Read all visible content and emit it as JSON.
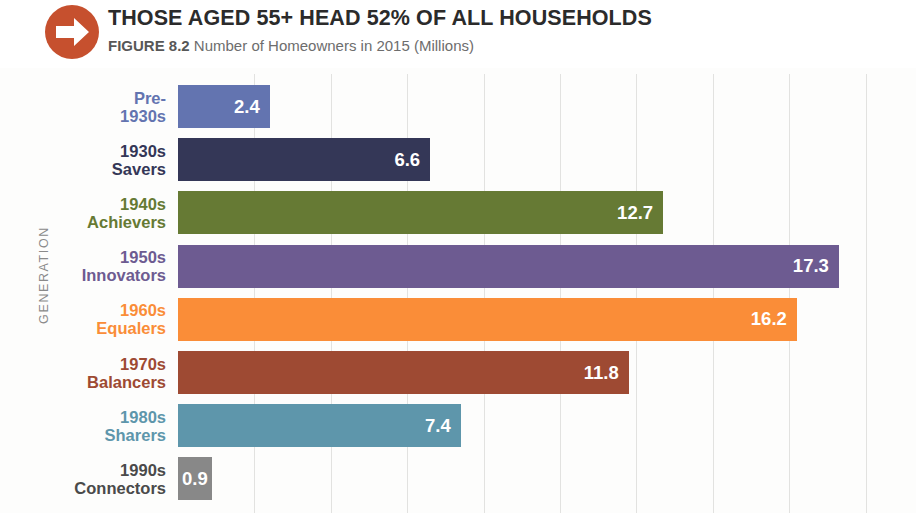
{
  "header": {
    "icon": "right-arrow-circle-icon",
    "icon_color": "#c6502e",
    "title": "THOSE AGED 55+ HEAD 52% OF ALL HOUSEHOLDS",
    "figure_label": "FIGURE 8.2",
    "subtitle": "Number of Homeowners in 2015 (Millions)"
  },
  "chart_data": {
    "type": "bar",
    "orientation": "horizontal",
    "title": "THOSE AGED 55+ HEAD 52% OF ALL HOUSEHOLDS",
    "subtitle": "Number of Homeowners in 2015 (Millions)",
    "xlabel": "",
    "ylabel": "GENERATION",
    "xlim": [
      0,
      19.3
    ],
    "ylim": [],
    "grid": true,
    "grid_axis": "x",
    "grid_step": 2,
    "gridline_values": [
      2,
      4,
      6,
      8,
      10,
      12,
      14,
      16,
      18
    ],
    "legend": "none",
    "tick_labels_visible": false,
    "categories": [
      "Pre-\n1930s",
      "1930s\nSavers",
      "1940s\nAchievers",
      "1950s\nInnovators",
      "1960s\nEqualers",
      "1970s\nBalancers",
      "1980s\nSharers",
      "1990s\nConnectors"
    ],
    "values": [
      2.4,
      6.6,
      12.7,
      17.3,
      16.2,
      11.8,
      7.4,
      0.9
    ],
    "value_labels": [
      "2.4",
      "6.6",
      "12.7",
      "17.3",
      "16.2",
      "11.8",
      "7.4",
      "0.9"
    ],
    "colors": [
      "#6374b0",
      "#343757",
      "#667a34",
      "#6d5b91",
      "#fa8d38",
      "#9e4a33",
      "#5e96ab",
      "#888888"
    ],
    "label_colors": [
      "#6374b0",
      "#343757",
      "#667a34",
      "#6d5b91",
      "#fa8d38",
      "#9e4a33",
      "#5e96ab",
      "#4a4a4a"
    ],
    "bars": [
      {
        "category": "Pre-\n1930s",
        "value": 2.4,
        "label": "2.4",
        "color": "#6374b0",
        "label_color": "#6374b0"
      },
      {
        "category": "1930s\nSavers",
        "value": 6.6,
        "label": "6.6",
        "color": "#343757",
        "label_color": "#343757"
      },
      {
        "category": "1940s\nAchievers",
        "value": 12.7,
        "label": "12.7",
        "color": "#667a34",
        "label_color": "#667a34"
      },
      {
        "category": "1950s\nInnovators",
        "value": 17.3,
        "label": "17.3",
        "color": "#6d5b91",
        "label_color": "#6d5b91"
      },
      {
        "category": "1960s\nEqualers",
        "value": 16.2,
        "label": "16.2",
        "color": "#fa8d38",
        "label_color": "#fa8d38"
      },
      {
        "category": "1970s\nBalancers",
        "value": 11.8,
        "label": "11.8",
        "color": "#9e4a33",
        "label_color": "#9e4a33"
      },
      {
        "category": "1980s\nSharers",
        "value": 7.4,
        "label": "7.4",
        "color": "#5e96ab",
        "label_color": "#5e96ab"
      },
      {
        "category": "1990s\nConnectors",
        "value": 0.9,
        "label": "0.9",
        "color": "#888888",
        "label_color": "#4a4a4a"
      }
    ]
  }
}
